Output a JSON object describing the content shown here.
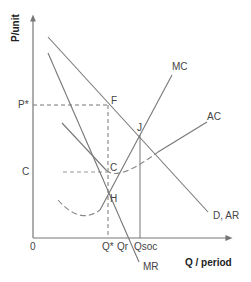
{
  "diagram": {
    "axes": {
      "y_label": "P/unit",
      "x_label": "Q / period",
      "origin": "0"
    },
    "curves": {
      "mc": "MC",
      "ac": "AC",
      "demand": "D, AR",
      "mr": "MR"
    },
    "points": {
      "f": "F",
      "j": "J",
      "c": "C",
      "h": "H"
    },
    "price_ticks": {
      "p_star": "P*",
      "c": "C"
    },
    "quantity_ticks": {
      "q_star": "Q*",
      "qr": "Qr",
      "qsoc": "Qsoc"
    },
    "colors": {
      "line": "#777777",
      "text": "#444444"
    }
  }
}
